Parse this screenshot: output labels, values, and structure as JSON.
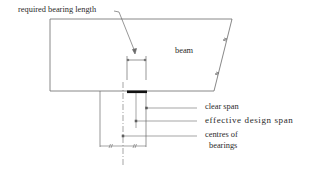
{
  "diagram": {
    "labels": {
      "required_bearing_length": "required bearing length",
      "beam": "beam",
      "clear_span": "clear span",
      "effective_design_span": "effective design span",
      "centres_of_bearings_line1": "centres of",
      "centres_of_bearings_line2": "bearings"
    },
    "colors": {
      "line": "#6a6a6a",
      "bearing": "#111111",
      "text": "#2a2a2a"
    }
  }
}
